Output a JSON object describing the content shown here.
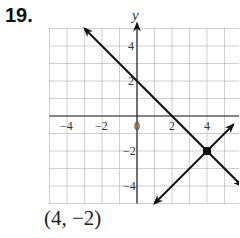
{
  "problem": {
    "number": "19.",
    "answer": "(4, −2)"
  },
  "chart_data": {
    "type": "line",
    "title": "",
    "xlabel": "x",
    "ylabel": "y",
    "xlim": [
      -5,
      6
    ],
    "ylim": [
      -5,
      5
    ],
    "grid": true,
    "x_tick_labels": [
      "−4",
      "−2",
      "0",
      "2",
      "4"
    ],
    "x_ticks": [
      -4,
      -2,
      0,
      2,
      4
    ],
    "y_tick_labels": [
      "4",
      "2",
      "−2",
      "−4"
    ],
    "y_ticks": [
      4,
      2,
      -2,
      -4
    ],
    "series": [
      {
        "name": "line 1",
        "equation": "y = -x + 2",
        "points": [
          [
            -3,
            5
          ],
          [
            6,
            -4
          ]
        ],
        "arrows": "both"
      },
      {
        "name": "line 2",
        "equation": "y = x - 6",
        "points": [
          [
            1,
            -5
          ],
          [
            5.5,
            -0.5
          ]
        ],
        "arrows": "both"
      }
    ],
    "annotations": [
      {
        "type": "point",
        "x": 4,
        "y": -2,
        "label": "intersection"
      }
    ]
  }
}
